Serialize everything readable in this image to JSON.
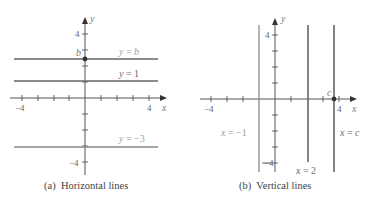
{
  "panel_a": {
    "caption": "(a)  Horizontal lines",
    "x_axis_label": "x",
    "y_axis_label": "y",
    "tick_labels": {
      "x_neg": "−4",
      "x_pos": "4",
      "y_pos": "4",
      "y_neg": "−4",
      "b": "b"
    },
    "lines": [
      {
        "label_var": "y",
        "label_eq": " = ",
        "label_val": "b",
        "value": "b"
      },
      {
        "label_var": "y",
        "label_eq": " = ",
        "label_val": "1",
        "value": 1
      },
      {
        "label_var": "y",
        "label_eq": " = ",
        "label_val": "−3",
        "value": -3
      }
    ]
  },
  "panel_b": {
    "caption": "(b)  Vertical lines",
    "x_axis_label": "x",
    "y_axis_label": "y",
    "tick_labels": {
      "x_neg": "−4",
      "x_pos": "4",
      "y_pos": "4",
      "y_neg": "−4",
      "c": "c"
    },
    "lines": [
      {
        "label_var": "x",
        "label_eq": " = ",
        "label_val": "−1",
        "value": -1
      },
      {
        "label_var": "x",
        "label_eq": " = ",
        "label_val": "2",
        "value": 2
      },
      {
        "label_var": "x",
        "label_eq": " = ",
        "label_val": "c",
        "value": "c"
      }
    ]
  }
}
